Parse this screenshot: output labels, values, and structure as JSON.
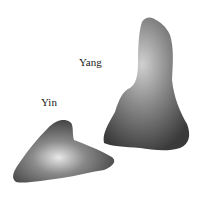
{
  "labels": {
    "yang": "Yang",
    "yin": "Yin"
  },
  "objects": [
    {
      "name": "yang-stone",
      "description": "tall upright stone"
    },
    {
      "name": "yin-stone",
      "description": "low triangular stone"
    }
  ],
  "colors": {
    "background": "#ffffff",
    "stone_dark": "#3a3a3a",
    "stone_mid": "#7a7a7a",
    "stone_light": "#d8d8d8",
    "text": "#1a1a1a"
  }
}
